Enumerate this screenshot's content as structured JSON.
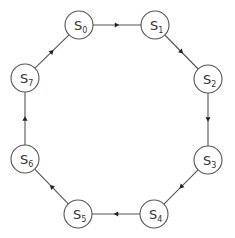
{
  "diagram": {
    "type": "state-cycle",
    "colors": {
      "line": "#555555",
      "arrow": "#222222",
      "background": "#ffffff",
      "text": "#333333"
    },
    "node_radius": 14,
    "nodes": [
      {
        "id": "S0",
        "letter": "S",
        "sub": "0",
        "x": 79,
        "y": 25
      },
      {
        "id": "S1",
        "letter": "S",
        "sub": "1",
        "x": 155,
        "y": 25
      },
      {
        "id": "S2",
        "letter": "S",
        "sub": "2",
        "x": 208,
        "y": 79
      },
      {
        "id": "S3",
        "letter": "S",
        "sub": "3",
        "x": 208,
        "y": 160
      },
      {
        "id": "S4",
        "letter": "S",
        "sub": "4",
        "x": 154,
        "y": 214
      },
      {
        "id": "S5",
        "letter": "S",
        "sub": "5",
        "x": 78,
        "y": 214
      },
      {
        "id": "S6",
        "letter": "S",
        "sub": "6",
        "x": 25,
        "y": 159
      },
      {
        "id": "S7",
        "letter": "S",
        "sub": "7",
        "x": 25,
        "y": 78
      }
    ],
    "edges": [
      {
        "from": "S0",
        "to": "S1"
      },
      {
        "from": "S1",
        "to": "S2"
      },
      {
        "from": "S2",
        "to": "S3"
      },
      {
        "from": "S3",
        "to": "S4"
      },
      {
        "from": "S4",
        "to": "S5"
      },
      {
        "from": "S5",
        "to": "S6"
      },
      {
        "from": "S6",
        "to": "S7"
      },
      {
        "from": "S7",
        "to": "S0"
      }
    ]
  }
}
